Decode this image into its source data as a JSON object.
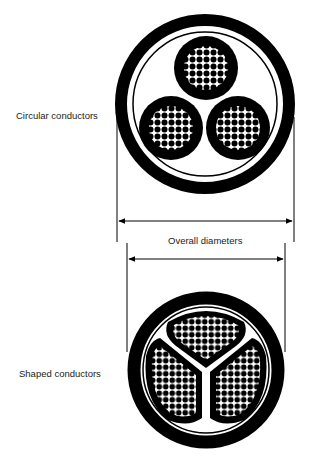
{
  "labels": {
    "circular": "Circular conductors",
    "shaped": "Shaped conductors",
    "dimension": "Overall diameters"
  },
  "diagram": {
    "type": "cable cross-section comparison",
    "cables": [
      {
        "name": "circular-conductor-cable",
        "cores": 3,
        "core_shape": "circular"
      },
      {
        "name": "shaped-conductor-cable",
        "cores": 3,
        "core_shape": "sector"
      }
    ],
    "colors": {
      "ink": "#000000",
      "background": "#ffffff"
    }
  }
}
